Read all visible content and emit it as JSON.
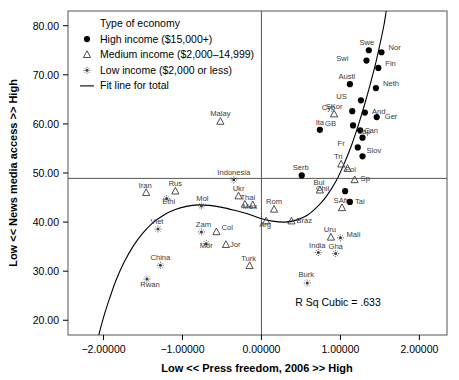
{
  "chart_data": {
    "type": "scatter",
    "title": "",
    "xlabel": "Low << Press freedom, 2006 >> High",
    "ylabel": "Low << News media access >> High",
    "xlim": [
      -2.45,
      2.35
    ],
    "ylim": [
      17.0,
      83.0
    ],
    "xticks": [
      "-2.00000",
      "-1.00000",
      "0.00000",
      "1.00000",
      "2.00000"
    ],
    "xtick_values": [
      -2,
      -1,
      0,
      1,
      2
    ],
    "yticks": [
      "80.00",
      "70.00",
      "60.00",
      "50.00",
      "40.00",
      "30.00",
      "20.00"
    ],
    "ytick_values": [
      80,
      70,
      60,
      50,
      40,
      30,
      20
    ],
    "grid": false,
    "reference_lines": {
      "horizontal_y": 48.9,
      "vertical_x": 0.0
    },
    "legend": {
      "title": "Type of economy",
      "position": "top-left-inside",
      "entries": [
        {
          "marker": "high-income-marker",
          "label": "High income ($15,000+)"
        },
        {
          "marker": "medium-income-marker",
          "label": "Medium income ($2,000–14,999)"
        },
        {
          "marker": "low-income-marker",
          "label": "Low income ($2,000 or less)"
        },
        {
          "marker": "fit-line-marker",
          "label": "Fit line for total"
        }
      ]
    },
    "annotation": "R Sq Cubic = .633",
    "series": [
      {
        "name": "High income ($15,000+)",
        "marker": "filled-circle",
        "points": [
          {
            "label": "Swe",
            "x": 1.36,
            "y": 75.0,
            "label_dx": -2,
            "label_dy": -5
          },
          {
            "label": "Nor",
            "x": 1.52,
            "y": 74.6,
            "label_dx": 7,
            "label_dy": -2
          },
          {
            "label": "Swi",
            "x": 1.33,
            "y": 72.9,
            "label_dx": -18,
            "label_dy": 0
          },
          {
            "label": "Fin",
            "x": 1.48,
            "y": 71.4,
            "label_dx": 7,
            "label_dy": -2
          },
          {
            "label": "Austl",
            "x": 1.12,
            "y": 68.1,
            "label_dx": -3,
            "label_dy": -5
          },
          {
            "label": "Neth",
            "x": 1.45,
            "y": 67.3,
            "label_dx": 7,
            "label_dy": -2
          },
          {
            "label": "US",
            "x": 1.26,
            "y": 64.8,
            "label_dx": -14,
            "label_dy": -1
          },
          {
            "label": "And",
            "x": 1.31,
            "y": 62.3,
            "label_dx": 7,
            "label_dy": 1
          },
          {
            "label": "Ger",
            "x": 1.46,
            "y": 61.4,
            "label_dx": 8,
            "label_dy": 2
          },
          {
            "label": "Cyp",
            "x": 1.15,
            "y": 62.6,
            "label_dx": -17,
            "label_dy": -1
          },
          {
            "label": "GB",
            "x": 1.16,
            "y": 59.7,
            "label_dx": -17,
            "label_dy": 1
          },
          {
            "label": "Can",
            "x": 1.25,
            "y": 58.7,
            "label_dx": 4,
            "label_dy": 3
          },
          {
            "label": "Jap",
            "x": 1.28,
            "y": 57.2,
            "label_dx": 2,
            "label_dy": -4
          },
          {
            "label": "Fr",
            "x": 1.22,
            "y": 55.2,
            "label_dx": -13,
            "label_dy": -1
          },
          {
            "label": "Slov",
            "x": 1.28,
            "y": 53.4,
            "label_dx": 4,
            "label_dy": -3
          },
          {
            "label": "Ita",
            "x": 0.74,
            "y": 58.8,
            "label_dx": 0,
            "label_dy": -5
          },
          {
            "label": "Serb",
            "x": 0.51,
            "y": 49.5,
            "label_dx": -1,
            "label_dy": -5
          },
          {
            "label": "Chil",
            "x": 1.06,
            "y": 46.3,
            "label_dx": -16,
            "label_dy": 0
          },
          {
            "label": "Tai",
            "x": 1.12,
            "y": 44.1,
            "label_dx": 5,
            "label_dy": 2
          }
        ]
      },
      {
        "name": "Medium income ($2,000–14,999)",
        "marker": "open-triangle",
        "points": [
          {
            "label": "Malay",
            "x": -0.52,
            "y": 60.5,
            "label_dx": 0,
            "label_dy": -5
          },
          {
            "label": "SKor",
            "x": 0.92,
            "y": 62.0,
            "label_dx": 0,
            "label_dy": -5
          },
          {
            "label": "Tri",
            "x": 1.01,
            "y": 51.8,
            "label_dx": -3,
            "label_dy": -5
          },
          {
            "label": "Pol",
            "x": 1.09,
            "y": 50.9,
            "label_dx": 3,
            "label_dy": 3
          },
          {
            "label": "Sp",
            "x": 1.18,
            "y": 48.6,
            "label_dx": 6,
            "label_dy": 1
          },
          {
            "label": "Bul",
            "x": 0.74,
            "y": 46.5,
            "label_dx": -1,
            "label_dy": -5
          },
          {
            "label": "SAfr",
            "x": 1.02,
            "y": 42.9,
            "label_dx": -1,
            "label_dy": -5
          },
          {
            "label": "Iran",
            "x": -1.46,
            "y": 46.0,
            "label_dx": -1,
            "label_dy": -5
          },
          {
            "label": "Rus",
            "x": -1.09,
            "y": 46.3,
            "label_dx": 0,
            "label_dy": -5
          },
          {
            "label": "Ukr",
            "x": -0.29,
            "y": 45.3,
            "label_dx": 0,
            "label_dy": -5
          },
          {
            "label": "Thai",
            "x": -0.21,
            "y": 43.6,
            "label_dx": 3,
            "label_dy": -4
          },
          {
            "label": "Mex",
            "x": -0.11,
            "y": 43.5,
            "label_dx": -3,
            "label_dy": 4
          },
          {
            "label": "Rom",
            "x": 0.16,
            "y": 42.6,
            "label_dx": 0,
            "label_dy": -5
          },
          {
            "label": "Arg",
            "x": 0.06,
            "y": 40.2,
            "label_dx": -1,
            "label_dy": 6
          },
          {
            "label": "Braz",
            "x": 0.38,
            "y": 40.2,
            "label_dx": 5,
            "label_dy": 2
          },
          {
            "label": "Col",
            "x": -0.57,
            "y": 38.0,
            "label_dx": 5,
            "label_dy": -2
          },
          {
            "label": "Jor",
            "x": -0.45,
            "y": 35.4,
            "label_dx": 4,
            "label_dy": 2
          },
          {
            "label": "Turk",
            "x": -0.15,
            "y": 31.1,
            "label_dx": -1,
            "label_dy": -5
          },
          {
            "label": "Uru",
            "x": 0.88,
            "y": 36.9,
            "label_dx": -1,
            "label_dy": -5
          }
        ]
      },
      {
        "name": "Low income ($2,000 or less)",
        "marker": "dotted-circle",
        "points": [
          {
            "label": "Indonesia",
            "x": -0.35,
            "y": 48.6,
            "label_dx": 0,
            "label_dy": -5
          },
          {
            "label": "Ethi",
            "x": -1.2,
            "y": 44.8,
            "label_dx": 2,
            "label_dy": 5
          },
          {
            "label": "Mol",
            "x": -0.76,
            "y": 43.3,
            "label_dx": 1,
            "label_dy": -5
          },
          {
            "label": "Viet",
            "x": -1.31,
            "y": 38.6,
            "label_dx": -1,
            "label_dy": -5
          },
          {
            "label": "Zam",
            "x": -0.76,
            "y": 38.0,
            "label_dx": 2,
            "label_dy": -5
          },
          {
            "label": "Mor",
            "x": -0.7,
            "y": 35.6,
            "label_dx": 0,
            "label_dy": 4
          },
          {
            "label": "China",
            "x": -1.28,
            "y": 31.2,
            "label_dx": 0,
            "label_dy": -5
          },
          {
            "label": "Rwan",
            "x": -1.45,
            "y": 28.4,
            "label_dx": 3,
            "label_dy": 8
          },
          {
            "label": "India",
            "x": 0.72,
            "y": 33.8,
            "label_dx": -1,
            "label_dy": -5
          },
          {
            "label": "Mali",
            "x": 1.0,
            "y": 36.8,
            "label_dx": 6,
            "label_dy": -1
          },
          {
            "label": "Gha",
            "x": 0.94,
            "y": 33.6,
            "label_dx": 0,
            "label_dy": -5
          },
          {
            "label": "Burk",
            "x": 0.58,
            "y": 27.6,
            "label_dx": -1,
            "label_dy": -6
          }
        ]
      }
    ],
    "fit_line": {
      "name": "Fit line for total",
      "kind": "cubic",
      "points": [
        [
          -2.06,
          17.0
        ],
        [
          -2.0,
          20.6
        ],
        [
          -1.92,
          24.6
        ],
        [
          -1.84,
          28.2
        ],
        [
          -1.74,
          31.8
        ],
        [
          -1.62,
          35.2
        ],
        [
          -1.5,
          37.8
        ],
        [
          -1.38,
          39.8
        ],
        [
          -1.24,
          41.4
        ],
        [
          -1.1,
          42.5
        ],
        [
          -0.95,
          43.2
        ],
        [
          -0.8,
          43.5
        ],
        [
          -0.66,
          43.4
        ],
        [
          -0.5,
          43.0
        ],
        [
          -0.34,
          42.4
        ],
        [
          -0.18,
          41.7
        ],
        [
          -0.02,
          40.8
        ],
        [
          0.14,
          40.2
        ],
        [
          0.3,
          40.0
        ],
        [
          0.44,
          40.4
        ],
        [
          0.58,
          41.4
        ],
        [
          0.7,
          43.0
        ],
        [
          0.82,
          45.2
        ],
        [
          0.94,
          48.2
        ],
        [
          1.04,
          51.6
        ],
        [
          1.14,
          55.6
        ],
        [
          1.22,
          59.4
        ],
        [
          1.3,
          63.6
        ],
        [
          1.38,
          68.2
        ],
        [
          1.45,
          72.6
        ],
        [
          1.5,
          76.2
        ],
        [
          1.55,
          80.0
        ],
        [
          1.58,
          83.0
        ]
      ]
    }
  }
}
